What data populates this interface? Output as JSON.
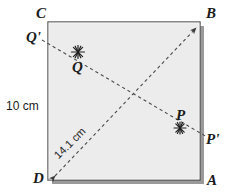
{
  "figure": {
    "shape": {
      "name": "square",
      "fill_color": "#ececec",
      "stroke_color": "#4d4d4d",
      "shadow_color": "#999999"
    },
    "line_color": "#555555",
    "text_color": "#1a1a1a"
  },
  "vertices": {
    "a": "A",
    "b": "B",
    "c": "C",
    "d": "D"
  },
  "points": {
    "p": "P",
    "p_prime": "P'",
    "q": "Q",
    "q_prime": "Q'"
  },
  "measurements": {
    "side": "10 cm",
    "diagonal": "14.1 cm"
  },
  "marks": {
    "star_p": "star-mark",
    "star_q": "star-mark",
    "arrow_b": "arrowhead",
    "arrow_d": "arrowhead"
  }
}
